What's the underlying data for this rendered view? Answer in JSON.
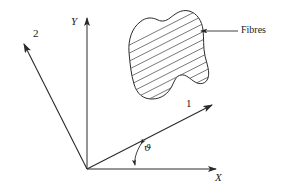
{
  "figure": {
    "background_color": "#ffffff",
    "line_color": "#2a2a2a",
    "hatch_color": "#555555",
    "text_color": "#1a1a1a"
  },
  "axes": {
    "global": [
      {
        "id": "X",
        "label": "X",
        "style": "italic-serif",
        "direction_deg": 0,
        "description": "horizontal global axis pointing right"
      },
      {
        "id": "Y",
        "label": "Y",
        "style": "italic-serif",
        "direction_deg": 90,
        "description": "vertical global axis pointing up"
      }
    ],
    "material": [
      {
        "id": "1",
        "label": "1",
        "style": "upright-serif",
        "direction_deg": 27,
        "description": "material axis 1, aligned with the fibre direction"
      },
      {
        "id": "2",
        "label": "2",
        "style": "upright-serif",
        "direction_deg": 117,
        "description": "material axis 2, perpendicular to the fibres"
      }
    ]
  },
  "angle": {
    "symbol": "ϑ",
    "description": "rotation angle from the X axis to material axis 1",
    "between": [
      "X",
      "1"
    ],
    "value_deg": 27,
    "arrow_style": "double-headed arc"
  },
  "callouts": [
    {
      "id": "fibres",
      "label": "Fibres",
      "leader": "horizontal line with arrowhead pointing left into the hatched region"
    }
  ],
  "region": {
    "name": "lamina-blob",
    "fill": "none",
    "hatching": {
      "description": "parallel straight lines indicating fibre direction",
      "angle_deg": 27,
      "count": 14,
      "spacing_px": 7
    }
  }
}
